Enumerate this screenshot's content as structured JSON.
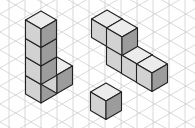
{
  "diagram": {
    "type": "isometric-cubes",
    "grid": {
      "color": "#cfcfcf",
      "vertical_spacing": 16,
      "x_start": 9
    },
    "colors": {
      "top": "#ececec",
      "left": "#d2d2d2",
      "right": "#9c9c9c",
      "edge": "#222222"
    },
    "cube": {
      "dx": 15.5,
      "dy": 9,
      "h": 18.5
    },
    "shapes": [
      {
        "name": "l-tower",
        "cubes": [
          [
            41,
            66.5
          ],
          [
            57,
            57
          ],
          [
            41,
            48
          ],
          [
            41,
            29.5
          ],
          [
            41,
            11
          ]
        ]
      },
      {
        "name": "step-row",
        "cubes": [
          [
            107,
            10
          ],
          [
            122,
            37
          ],
          [
            137,
            46
          ],
          [
            152,
            55
          ],
          [
            122,
            19
          ]
        ]
      },
      {
        "name": "single-cube",
        "cubes": [
          [
            106,
            83
          ]
        ]
      }
    ]
  }
}
